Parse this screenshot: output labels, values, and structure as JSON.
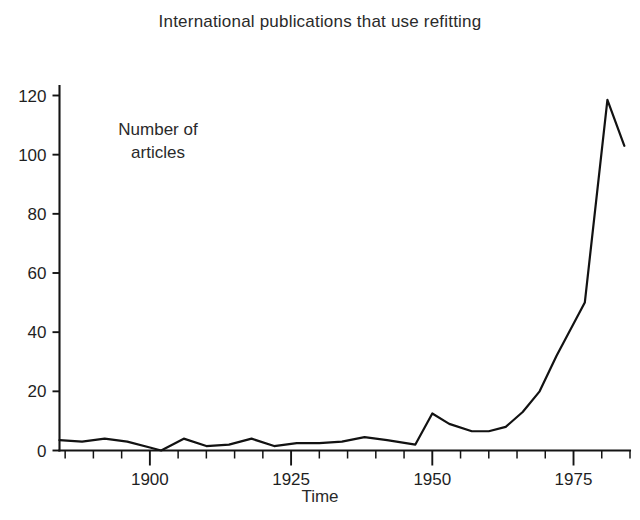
{
  "chart_data": {
    "type": "line",
    "title": "International publications that use refitting",
    "xlabel": "Time",
    "ylabel": "",
    "annotation": {
      "line1": "Number of",
      "line2": "articles"
    },
    "xlim": [
      1884,
      1985
    ],
    "ylim": [
      0,
      128
    ],
    "grid": false,
    "legend": null,
    "x_ticks_major": [
      1900,
      1925,
      1950,
      1975
    ],
    "x_tick_labels": [
      "1900",
      "1925",
      "1950",
      "1975"
    ],
    "x_ticks_minor": [
      1885,
      1890,
      1895,
      1905,
      1910,
      1915,
      1920,
      1930,
      1935,
      1940,
      1945,
      1955,
      1960,
      1965,
      1970,
      1980,
      1985
    ],
    "y_ticks": [
      0,
      20,
      40,
      60,
      80,
      100,
      120
    ],
    "y_tick_labels": [
      "0",
      "20",
      "40",
      "60",
      "80",
      "100",
      "120"
    ],
    "series": [
      {
        "name": "Number of articles",
        "color": "#121212",
        "x": [
          1884,
          1888,
          1892,
          1896,
          1900,
          1902,
          1906,
          1910,
          1914,
          1918,
          1922,
          1926,
          1930,
          1934,
          1938,
          1942,
          1947,
          1950,
          1953,
          1957,
          1960,
          1963,
          1966,
          1969,
          1972,
          1977,
          1981,
          1984
        ],
        "y": [
          3.5,
          3,
          4,
          3,
          1,
          0,
          4,
          1.5,
          2,
          4,
          1.5,
          2.5,
          2.5,
          3,
          4.5,
          3.5,
          2,
          12.5,
          9,
          6.5,
          6.5,
          8,
          13,
          20,
          32,
          50,
          118.5,
          103
        ]
      }
    ]
  },
  "axis_colors": {
    "axis": "#141414",
    "text": "#1f1f1f"
  }
}
